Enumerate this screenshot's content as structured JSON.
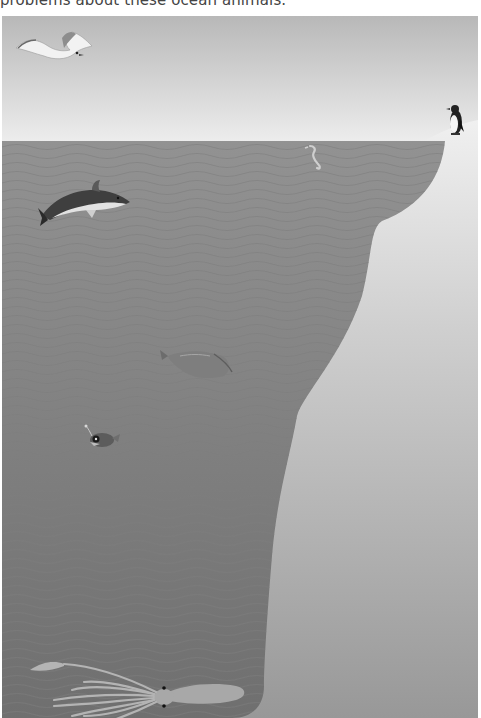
{
  "caption": {
    "text": "problems about these ocean animals."
  },
  "scene": {
    "title": "Ocean depth illustration",
    "colors": {
      "sky_top": "#b9b9b9",
      "sky_bottom": "#ececec",
      "water": "#8e8e8e",
      "water_deep": "#737373",
      "wave_line": "#7c7c7c",
      "land_top": "#efefef",
      "land_bottom": "#989898"
    },
    "animals": [
      {
        "name": "seagull",
        "zone": "sky"
      },
      {
        "name": "penguin",
        "zone": "surface"
      },
      {
        "name": "dolphin",
        "zone": "sunlight"
      },
      {
        "name": "seahorse",
        "zone": "sunlight"
      },
      {
        "name": "fish",
        "zone": "twilight"
      },
      {
        "name": "anglerfish",
        "zone": "twilight"
      },
      {
        "name": "giant-squid",
        "zone": "midnight"
      }
    ]
  }
}
